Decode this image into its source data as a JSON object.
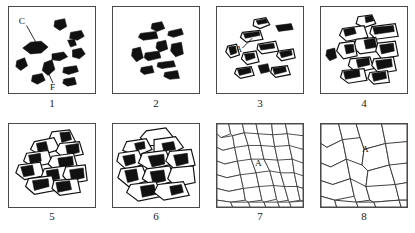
{
  "figure": {
    "title": "",
    "panel_count": 8,
    "rows": 2,
    "columns": 4,
    "colors": {
      "particle_fill": "#111111",
      "grain_stroke": "#3b3b3b",
      "panel_border": "#4a4a4a",
      "background": "#ffffff"
    }
  },
  "panels": [
    {
      "number": "1",
      "caption_label": "1",
      "description": "loose angular dark particles, coarse and fine",
      "labels": [
        {
          "text": "C",
          "x": 14,
          "y": 16
        },
        {
          "text": "F",
          "x": 43,
          "y": 82
        }
      ]
    },
    {
      "number": "2",
      "caption_label": "2",
      "description": "rearranged dark particles clustered toward centre",
      "labels": []
    },
    {
      "number": "3",
      "caption_label": "3",
      "description": "fragmented particles with light interiors",
      "labels": [
        {
          "text": "A",
          "x": 22,
          "y": 44
        }
      ]
    },
    {
      "number": "4",
      "caption_label": "4",
      "description": "deformed particles in contact, early necking",
      "labels": []
    },
    {
      "number": "5",
      "caption_label": "5",
      "description": "compacted interlocking fragment cluster",
      "labels": []
    },
    {
      "number": "6",
      "caption_label": "6",
      "description": "sintered mass with residual dark pores",
      "labels": []
    },
    {
      "number": "7",
      "caption_label": "7",
      "description": "fine equiaxed polycrystalline grain structure",
      "labels": [
        {
          "text": "A",
          "x": 43,
          "y": 40
        }
      ]
    },
    {
      "number": "8",
      "caption_label": "8",
      "description": "coarse grains after grain growth",
      "labels": [
        {
          "text": "A",
          "x": 46,
          "y": 26
        }
      ]
    }
  ]
}
